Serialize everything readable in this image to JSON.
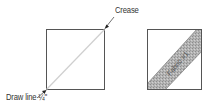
{
  "diagram": {
    "left_panel": {
      "crease_label": "Crease",
      "draw_line_label": "Draw line ¼\""
    },
    "right_panel": {
      "band_label": "Fabric #1"
    },
    "colors": {
      "outline": "#555555",
      "diagonal_line": "#c8c8c8",
      "band_fill": "#a8a8a8",
      "text": "#333333"
    }
  }
}
